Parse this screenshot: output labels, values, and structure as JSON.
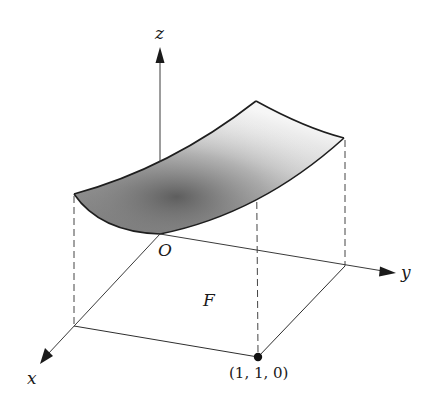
{
  "figure": {
    "labels": {
      "z_axis": "z",
      "y_axis": "y",
      "x_axis": "x",
      "origin": "O",
      "region": "F",
      "corner_point": "(1, 1, 0)"
    },
    "colors": {
      "ink": "#1e1e1e",
      "surface_dark": "#6e6e6e",
      "surface_light": "#f4f4f4",
      "background": "#ffffff"
    },
    "points": {
      "origin": [
        160,
        234
      ],
      "z_tip": [
        160,
        47
      ],
      "y_tip": [
        395,
        273
      ],
      "x_tip": [
        40,
        364
      ],
      "corner_x": [
        74,
        326
      ],
      "corner_xy": [
        258,
        357
      ],
      "corner_y": [
        345,
        266
      ],
      "surface_x0": [
        74,
        194
      ],
      "surface_far": [
        256,
        101
      ],
      "surface_y1": [
        344,
        138
      ]
    }
  }
}
